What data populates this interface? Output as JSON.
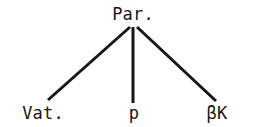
{
  "figure": {
    "kind": "stemma-codicum",
    "background_color": "#ffffff",
    "line_color": "#171717",
    "text_color": "#171717",
    "width": 253,
    "height": 127
  },
  "nodes": {
    "root": {
      "label": "Par.",
      "x": 133,
      "y": 22
    },
    "left": {
      "label": "Vat.",
      "x": 43,
      "y": 122
    },
    "middle": {
      "label": "p",
      "x": 134,
      "y": 122
    },
    "right": {
      "label": "βK",
      "x": 217,
      "y": 122
    }
  },
  "edges": [
    {
      "name": "root-to-left",
      "from": "root",
      "to": "left",
      "x1": 130,
      "y1": 27,
      "x2": 48,
      "y2": 100
    },
    {
      "name": "root-to-middle",
      "from": "root",
      "to": "middle",
      "x1": 133,
      "y1": 27,
      "x2": 133,
      "y2": 103
    },
    {
      "name": "root-to-right",
      "from": "root",
      "to": "right",
      "x1": 137,
      "y1": 27,
      "x2": 216,
      "y2": 101
    }
  ],
  "stroke_width": 3
}
